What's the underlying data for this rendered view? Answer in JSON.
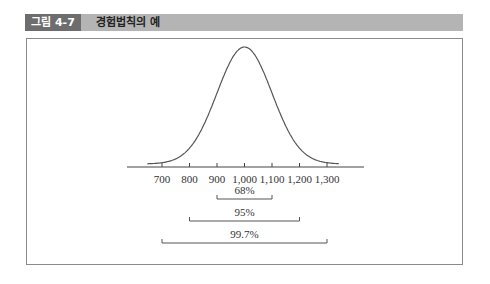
{
  "figure": {
    "tag": "그림 4-7",
    "title": "경험법칙의 예"
  },
  "colors": {
    "header_bar": "#b4b4b4",
    "header_tag": "#6d6d6d",
    "frame": "#8a8a8a",
    "curve": "#555555",
    "text": "#333333"
  },
  "chart_data": {
    "type": "line",
    "title": "경험법칙의 예",
    "mean": 1000,
    "std_dev": 100,
    "xlabel": "",
    "ylabel": "",
    "x_ticks": [
      700,
      800,
      900,
      1000,
      1100,
      1200,
      1300
    ],
    "x_tick_labels": [
      "700",
      "800",
      "900",
      "1,000",
      "1,100",
      "1,200",
      "1,300"
    ],
    "xlim": [
      650,
      1400
    ],
    "grid": false,
    "legend": null,
    "intervals": [
      {
        "label": "68%",
        "from": 900,
        "to": 1100
      },
      {
        "label": "95%",
        "from": 800,
        "to": 1200
      },
      {
        "label": "99.7%",
        "from": 700,
        "to": 1300
      }
    ]
  }
}
